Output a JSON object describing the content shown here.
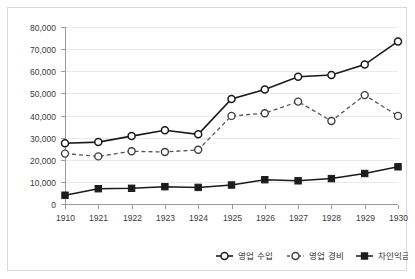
{
  "chart_data": {
    "type": "line",
    "title": "",
    "subtitle": "",
    "xlabel": "",
    "ylabel": "",
    "grid": true,
    "legend_position": "bottom-right",
    "ylim": [
      0,
      80000
    ],
    "ytick_labels": [
      "80,000",
      "70,000",
      "60,000",
      "50,000",
      "40,000",
      "30,000",
      "20,000",
      "10,000",
      "0"
    ],
    "ytick_values": [
      80000,
      70000,
      60000,
      50000,
      40000,
      30000,
      20000,
      10000,
      0
    ],
    "categories": [
      "1910",
      "1921",
      "1922",
      "1923",
      "1924",
      "1925",
      "1926",
      "1927",
      "1928",
      "1929",
      "1930"
    ],
    "series": [
      {
        "name": "영업 수입",
        "marker": "open-circle",
        "line_style": "solid",
        "color": "#1a1a1a",
        "values": [
          27500,
          28000,
          30700,
          33300,
          31500,
          47500,
          51800,
          57500,
          58300,
          63000,
          73500
        ]
      },
      {
        "name": "영업 경비",
        "marker": "open-circle",
        "line_style": "dashed",
        "color": "#555555",
        "values": [
          22800,
          21500,
          23800,
          23500,
          24500,
          39800,
          41000,
          46300,
          37500,
          49200,
          39800
        ]
      },
      {
        "name": "차인익금",
        "marker": "filled-square",
        "line_style": "solid",
        "color": "#1c1c1c",
        "values": [
          4000,
          6900,
          7100,
          7800,
          7500,
          8600,
          11000,
          10500,
          11500,
          13800,
          16800
        ]
      }
    ]
  },
  "legend": {
    "items": [
      {
        "label": "영업 수입",
        "marker": "open-circle-solid"
      },
      {
        "label": "영업 경비",
        "marker": "open-circle-dashed"
      },
      {
        "label": "차인익금",
        "marker": "filled-square-solid"
      }
    ]
  }
}
